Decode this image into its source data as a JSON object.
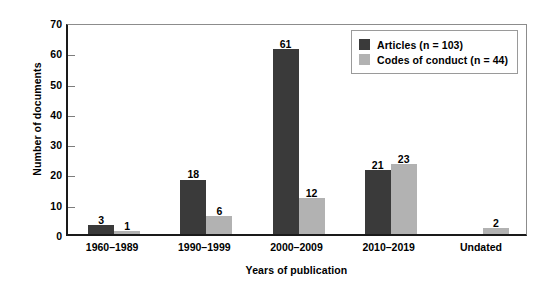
{
  "chart_data": {
    "type": "bar",
    "title": "",
    "xlabel": "Years of publication",
    "ylabel": "Number of documents",
    "categories": [
      "1960–1989",
      "1990–1999",
      "2000–2009",
      "2010–2019",
      "Undated"
    ],
    "series": [
      {
        "name": "Articles (n = 103)",
        "color": "#3a3a3a",
        "values": [
          3,
          18,
          61,
          21,
          null
        ]
      },
      {
        "name": "Codes of conduct (n = 44)",
        "color": "#b2b2b2",
        "values": [
          1,
          6,
          12,
          23,
          2
        ]
      }
    ],
    "ylim": [
      0,
      70
    ],
    "yticks": [
      0,
      10,
      20,
      30,
      40,
      50,
      60,
      70
    ],
    "ytick_labels": [
      "0",
      "10",
      "20",
      "30",
      "40",
      "50",
      "60",
      "70"
    ],
    "grid": false,
    "legend_position": "top-right",
    "bar_labels": [
      [
        "3",
        "1"
      ],
      [
        "18",
        "6"
      ],
      [
        "61",
        "12"
      ],
      [
        "21",
        "23"
      ],
      [
        "",
        "2"
      ]
    ]
  },
  "legend": {
    "entries": [
      {
        "label": "Articles (n = 103)",
        "swatch": "dark"
      },
      {
        "label": "Codes of conduct (n = 44)",
        "swatch": "light"
      }
    ]
  },
  "axes": {
    "y_title": "Number of documents",
    "x_title": "Years of publication"
  }
}
